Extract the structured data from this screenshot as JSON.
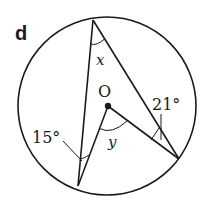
{
  "figure": {
    "label": "d",
    "center_label": "O",
    "angles": {
      "top": "x",
      "center": "y",
      "left": "15°",
      "right": "21°"
    },
    "colors": {
      "stroke": "#1a1a1a",
      "background": "#ffffff"
    },
    "geometry": {
      "circle": {
        "cx": 107,
        "cy": 106,
        "r": 89
      },
      "points": {
        "top": [
          93,
          20
        ],
        "bottom_left": [
          78,
          186
        ],
        "right": [
          179,
          159
        ],
        "center": [
          108,
          106
        ]
      }
    }
  }
}
